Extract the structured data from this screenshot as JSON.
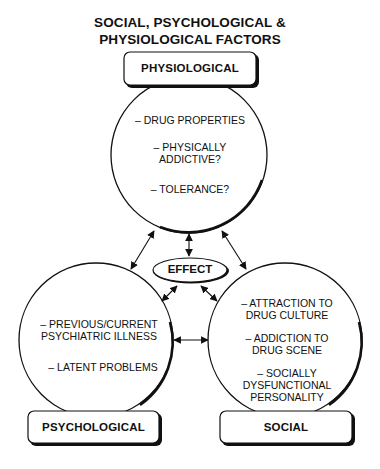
{
  "title": {
    "line1": "SOCIAL, PSYCHOLOGICAL &",
    "line2": "PHYSIOLOGICAL FACTORS"
  },
  "center": {
    "label": "EFFECT"
  },
  "nodes": [
    {
      "id": "physiological",
      "label": "PHYSIOLOGICAL",
      "items": [
        {
          "line1": "– DRUG PROPERTIES",
          "line2": ""
        },
        {
          "line1": "– PHYSICALLY",
          "line2": "ADDICTIVE?"
        },
        {
          "line1": "– TOLERANCE?",
          "line2": ""
        }
      ]
    },
    {
      "id": "psychological",
      "label": "PSYCHOLOGICAL",
      "items": [
        {
          "line1": "– PREVIOUS/CURRENT",
          "line2": "PSYCHIATRIC ILLNESS"
        },
        {
          "line1": "– LATENT PROBLEMS",
          "line2": ""
        }
      ]
    },
    {
      "id": "social",
      "label": "SOCIAL",
      "items": [
        {
          "line1": "– ATTRACTION TO",
          "line2": "DRUG CULTURE"
        },
        {
          "line1": "– ADDICTION TO",
          "line2": "DRUG SCENE"
        },
        {
          "line1": "– SOCIALLY",
          "line2": "DYSFUNCTIONAL",
          "line3": "PERSONALITY"
        }
      ]
    }
  ],
  "connections": [
    {
      "from": "physiological",
      "to": "effect",
      "type": "bidirectional"
    },
    {
      "from": "physiological",
      "to": "psychological",
      "type": "bidirectional"
    },
    {
      "from": "physiological",
      "to": "social",
      "type": "bidirectional"
    },
    {
      "from": "psychological",
      "to": "effect",
      "type": "bidirectional"
    },
    {
      "from": "social",
      "to": "effect",
      "type": "bidirectional"
    },
    {
      "from": "psychological",
      "to": "social",
      "type": "bidirectional"
    }
  ],
  "colors": {
    "stroke": "#111111",
    "fill": "#ffffff",
    "text": "#111111"
  }
}
